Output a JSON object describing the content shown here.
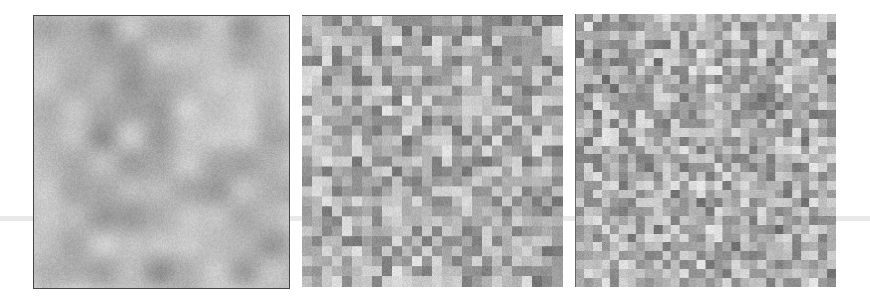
{
  "figure": {
    "background": "#ffffff",
    "panels": [
      {
        "id": "p1",
        "kind": "smooth",
        "cells_x": 9,
        "cells_y": 10,
        "seed": 11,
        "min_gray": 120,
        "max_gray": 225,
        "blur": 9
      },
      {
        "id": "p2",
        "kind": "blocky",
        "cells_x": 26,
        "cells_y": 27,
        "seed": 23,
        "min_gray": 95,
        "max_gray": 228,
        "blur": 0
      },
      {
        "id": "p3",
        "kind": "blocky",
        "cells_x": 30,
        "cells_y": 31,
        "seed": 37,
        "min_gray": 85,
        "max_gray": 230,
        "blur": 0
      }
    ]
  }
}
